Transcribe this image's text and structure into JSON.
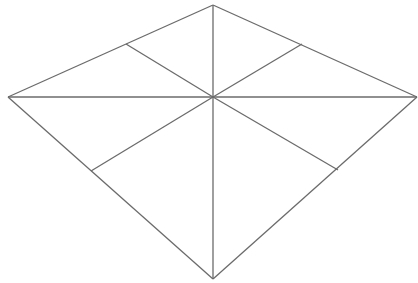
{
  "diagram": {
    "type": "quadrilateral-subdivision",
    "stroke_color": "#6b6b6b",
    "background": "#ffffff",
    "vertices": {
      "top": [
        213,
        5
      ],
      "left": [
        8,
        97
      ],
      "right": [
        417,
        97
      ],
      "bottom": [
        213,
        279
      ],
      "center": [
        213,
        97
      ],
      "upper_left_mid": [
        126,
        44
      ],
      "upper_right_mid": [
        302,
        44
      ],
      "lower_left_mid": [
        91,
        171
      ],
      "lower_right_mid": [
        338,
        170
      ]
    },
    "edges": [
      [
        "top",
        "left"
      ],
      [
        "top",
        "right"
      ],
      [
        "left",
        "bottom"
      ],
      [
        "right",
        "bottom"
      ],
      [
        "top",
        "bottom"
      ],
      [
        "left",
        "right"
      ],
      [
        "center",
        "upper_left_mid"
      ],
      [
        "center",
        "upper_right_mid"
      ],
      [
        "center",
        "lower_left_mid"
      ],
      [
        "center",
        "lower_right_mid"
      ]
    ]
  }
}
